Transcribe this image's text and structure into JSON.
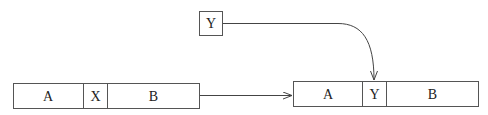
{
  "diagram": {
    "insert_box": {
      "label": "Y"
    },
    "before": {
      "segments": [
        {
          "label": "A"
        },
        {
          "label": "X"
        },
        {
          "label": "B"
        }
      ]
    },
    "after": {
      "segments": [
        {
          "label": "A"
        },
        {
          "label": "Y"
        },
        {
          "label": "B"
        }
      ]
    },
    "colors": {
      "stroke": "#555555",
      "text": "#222222",
      "background": "#ffffff"
    }
  }
}
